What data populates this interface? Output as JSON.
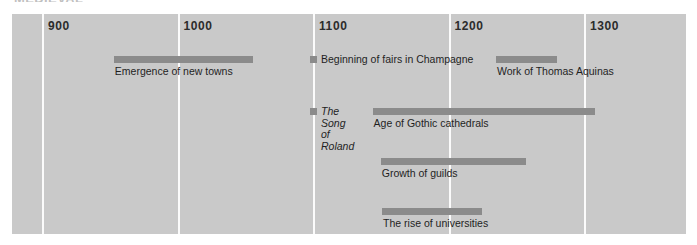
{
  "figure": {
    "heading_remnant": "MEDIEVAL",
    "panel_color": "#c9c9c9",
    "bar_color": "#8b8b8b",
    "gridline_color": "#fbfbfb",
    "page_background": "#ffffff"
  },
  "chart_data": {
    "type": "bar",
    "orientation": "horizontal-timeline",
    "title": "",
    "subtitle": "",
    "xlabel": "",
    "ylabel": "",
    "xlim": [
      880,
      1330
    ],
    "grid": true,
    "legend": "none",
    "tick_labels": [
      "900",
      "1000",
      "1100",
      "1200",
      "1300"
    ],
    "ticks": [
      900,
      1000,
      1100,
      1200,
      1300
    ],
    "events": [
      {
        "label": "Emergence of new towns",
        "kind": "span",
        "start": 953,
        "end": 1056,
        "row": 0,
        "label_style": "below",
        "label_italic": false
      },
      {
        "label": "Beginning of fairs in Champagne",
        "kind": "point",
        "start": 1100,
        "end": 1100,
        "row": 0,
        "label_style": "right",
        "label_italic": false
      },
      {
        "label": "Work of Thomas Aquinas",
        "kind": "span",
        "start": 1235,
        "end": 1280,
        "row": 0,
        "label_style": "below",
        "label_italic": false
      },
      {
        "label": "The Song\nof Roland",
        "kind": "point",
        "start": 1100,
        "end": 1100,
        "row": 1,
        "label_style": "right",
        "label_italic": true
      },
      {
        "label": "Age of Gothic cathedrals",
        "kind": "span",
        "start": 1144,
        "end": 1308,
        "row": 1,
        "label_style": "below",
        "label_italic": false
      },
      {
        "label": "Growth of guilds",
        "kind": "span",
        "start": 1150,
        "end": 1257,
        "row": 2,
        "label_style": "below",
        "label_italic": false
      },
      {
        "label": "The rise of universities",
        "kind": "span",
        "start": 1151,
        "end": 1225,
        "row": 3,
        "label_style": "below",
        "label_italic": false
      }
    ]
  }
}
